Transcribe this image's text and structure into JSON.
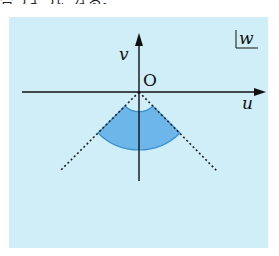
{
  "caption": "合うように なる。",
  "figure": {
    "plane_label": "w",
    "axis_x_label": "u",
    "axis_y_label": "v",
    "origin_label": "O",
    "colors": {
      "background": "#cfeef7",
      "sector_fill": "#6cb6ea",
      "sector_stroke": "#3d8fd0",
      "axis": "#111111"
    },
    "region": {
      "shape": "annular sector",
      "center": "O",
      "direction": "downward (negative v)",
      "angle_span_deg": 90,
      "inner_radius_px": 20,
      "outer_radius_px": 58
    }
  }
}
